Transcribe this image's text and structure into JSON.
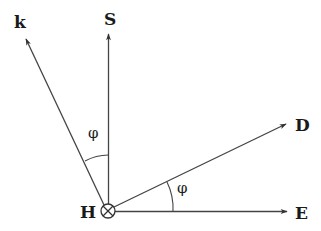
{
  "diagram": {
    "origin": {
      "label": "H",
      "symbol": "into-page-cross",
      "x": 108,
      "y": 211
    },
    "vectors": [
      {
        "label": "k",
        "tip": [
          25,
          37
        ],
        "label_pos": [
          20,
          24
        ]
      },
      {
        "label": "S",
        "tip": [
          110,
          32
        ],
        "label_pos": [
          110,
          24
        ]
      },
      {
        "label": "D",
        "tip": [
          287,
          124
        ],
        "label_pos": [
          302,
          130
        ]
      },
      {
        "label": "E",
        "tip": [
          288,
          212
        ],
        "label_pos": [
          302,
          218
        ]
      }
    ],
    "angles": [
      {
        "label": "φ",
        "between": [
          "k",
          "S"
        ],
        "label_pos": [
          94,
          137
        ]
      },
      {
        "label": "φ",
        "between": [
          "E",
          "D"
        ],
        "label_pos": [
          182,
          191
        ]
      }
    ],
    "stroke_color": "#333333"
  }
}
